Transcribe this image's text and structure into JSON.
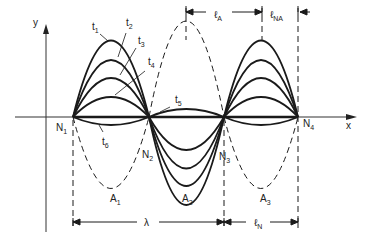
{
  "diagram": {
    "axes": {
      "x_label": "x",
      "y_label": "y"
    },
    "nodes": [
      {
        "label": "N",
        "sub": "1"
      },
      {
        "label": "N",
        "sub": "2"
      },
      {
        "label": "N",
        "sub": "3"
      },
      {
        "label": "N",
        "sub": "4"
      }
    ],
    "antinodes": [
      {
        "label": "A",
        "sub": "1"
      },
      {
        "label": "A",
        "sub": "2"
      },
      {
        "label": "A",
        "sub": "3"
      }
    ],
    "time_labels": [
      {
        "label": "t",
        "sub": "1"
      },
      {
        "label": "t",
        "sub": "2"
      },
      {
        "label": "t",
        "sub": "3"
      },
      {
        "label": "t",
        "sub": "4"
      },
      {
        "label": "t",
        "sub": "5"
      },
      {
        "label": "t",
        "sub": "6"
      }
    ],
    "dimensions": {
      "antinode_length": {
        "label": "ℓ",
        "sub": "A"
      },
      "non_antinode_length": {
        "label": "ℓ",
        "sub": "NA"
      },
      "wavelength": {
        "label": "λ"
      },
      "node_length": {
        "label": "ℓ",
        "sub": "N"
      }
    },
    "colors": {
      "stroke": "#1a1a1a",
      "background": "#ffffff"
    }
  }
}
